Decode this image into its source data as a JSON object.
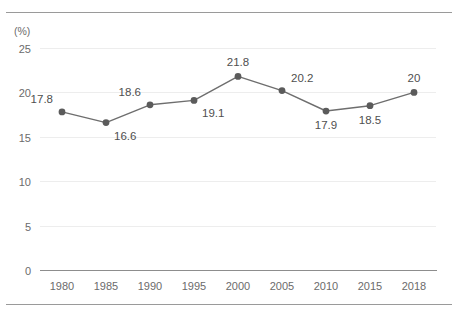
{
  "chart_data": {
    "type": "line",
    "title": "",
    "subtitle": "",
    "xlabel": "",
    "ylabel": "",
    "unit_label": "(%)",
    "categories": [
      "1980",
      "1985",
      "1990",
      "1995",
      "2000",
      "2005",
      "2010",
      "2015",
      "2018"
    ],
    "values": [
      17.8,
      16.6,
      18.6,
      19.1,
      21.8,
      20.2,
      17.9,
      18.5,
      20
    ],
    "point_labels": [
      "17.8",
      "16.6",
      "18.6",
      "19.1",
      "21.8",
      "20.2",
      "17.9",
      "18.5",
      "20"
    ],
    "label_positions": [
      "above-left",
      "below-right",
      "above-left",
      "below-right",
      "above",
      "above-right",
      "below",
      "below",
      "above"
    ],
    "ylim": [
      0,
      25
    ],
    "yticks": [
      0,
      5,
      10,
      15,
      20,
      25
    ],
    "ytick_labels": [
      "0",
      "5",
      "10",
      "15",
      "20",
      "25"
    ],
    "grid": true,
    "legend": "none",
    "series_color": "#6e6e6e",
    "marker_color": "#5b5b5b",
    "grid_color": "#ededed",
    "axis_color": "#8d8d8d",
    "text_color": "#6b6b6b"
  }
}
